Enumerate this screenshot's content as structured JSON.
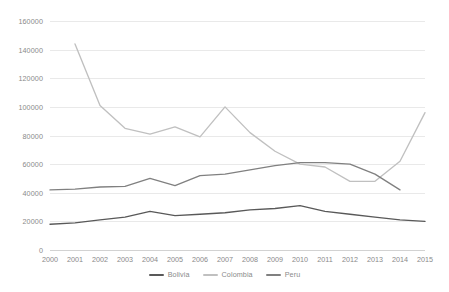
{
  "chart_data": {
    "type": "line",
    "title": "",
    "subtitle": "",
    "xlabel": "",
    "ylabel": "",
    "x": [
      2000,
      2001,
      2002,
      2003,
      2004,
      2005,
      2006,
      2007,
      2008,
      2009,
      2010,
      2011,
      2012,
      2013,
      2014,
      2015
    ],
    "categories": [
      "2000",
      "2001",
      "2002",
      "2003",
      "2004",
      "2005",
      "2006",
      "2007",
      "2008",
      "2009",
      "2010",
      "2011",
      "2012",
      "2013",
      "2014",
      "2015"
    ],
    "series": [
      {
        "name": "Bolivia",
        "color": "#595959",
        "values": [
          18000,
          19000,
          21000,
          23000,
          27000,
          24000,
          25000,
          26000,
          28000,
          29000,
          31000,
          27000,
          25000,
          23000,
          21000,
          20000
        ]
      },
      {
        "name": "Colombia",
        "color": "#c0c0c0",
        "values": [
          null,
          144000,
          101000,
          85000,
          81000,
          86000,
          79000,
          100000,
          82000,
          69000,
          60000,
          58000,
          48000,
          48000,
          62000,
          96000
        ]
      },
      {
        "name": "Peru",
        "color": "#808080",
        "values": [
          42000,
          42500,
          44000,
          44500,
          50000,
          45000,
          52000,
          53000,
          56000,
          59000,
          61000,
          61000,
          60000,
          53000,
          42000,
          null
        ]
      }
    ],
    "ylim": [
      0,
      160000
    ],
    "y_ticks": [
      0,
      20000,
      40000,
      60000,
      80000,
      100000,
      120000,
      140000,
      160000
    ],
    "y_tick_labels": [
      "0",
      "20000",
      "40000",
      "60000",
      "80000",
      "100000",
      "120000",
      "140000",
      "160000"
    ],
    "xlim": [
      2000,
      2015
    ],
    "grid": {
      "horizontal": true,
      "vertical": false,
      "color": "#e9e9e9"
    },
    "legend": {
      "position": "bottom",
      "entries": [
        {
          "label": "Bolivia",
          "color": "#595959"
        },
        {
          "label": "Colombia",
          "color": "#c0c0c0"
        },
        {
          "label": "Peru",
          "color": "#808080"
        }
      ]
    },
    "axis_color": "#d2d2d2",
    "tick_label_color": "#8a8a8a",
    "background": "#ffffff"
  }
}
